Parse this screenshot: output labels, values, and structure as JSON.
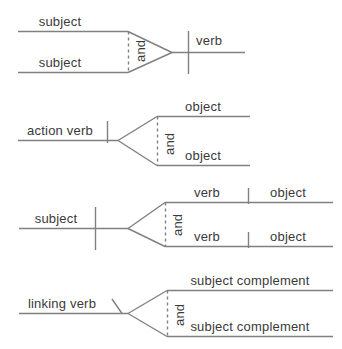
{
  "figure": {
    "line_color": "#808080",
    "text_color": "#3a3a3a",
    "background": "#ffffff",
    "conjunction": "and"
  },
  "diagrams": [
    {
      "id": "compound-subject",
      "name": "compound-subject-diagram",
      "conjunction": "and",
      "labels": {
        "top_left": "subject",
        "bottom_left": "subject",
        "right": "verb"
      }
    },
    {
      "id": "compound-object",
      "name": "compound-object-diagram",
      "conjunction": "and",
      "labels": {
        "left": "action verb",
        "top_right": "object",
        "bottom_right": "object"
      }
    },
    {
      "id": "compound-predicate",
      "name": "compound-predicate-diagram",
      "conjunction": "and",
      "labels": {
        "left": "subject",
        "top_verb": "verb",
        "top_object": "object",
        "bottom_verb": "verb",
        "bottom_object": "object"
      }
    },
    {
      "id": "compound-subject-complement",
      "name": "compound-subject-complement-diagram",
      "conjunction": "and",
      "labels": {
        "left": "linking verb",
        "top_right": "subject complement",
        "bottom_right": "subject complement"
      }
    }
  ]
}
